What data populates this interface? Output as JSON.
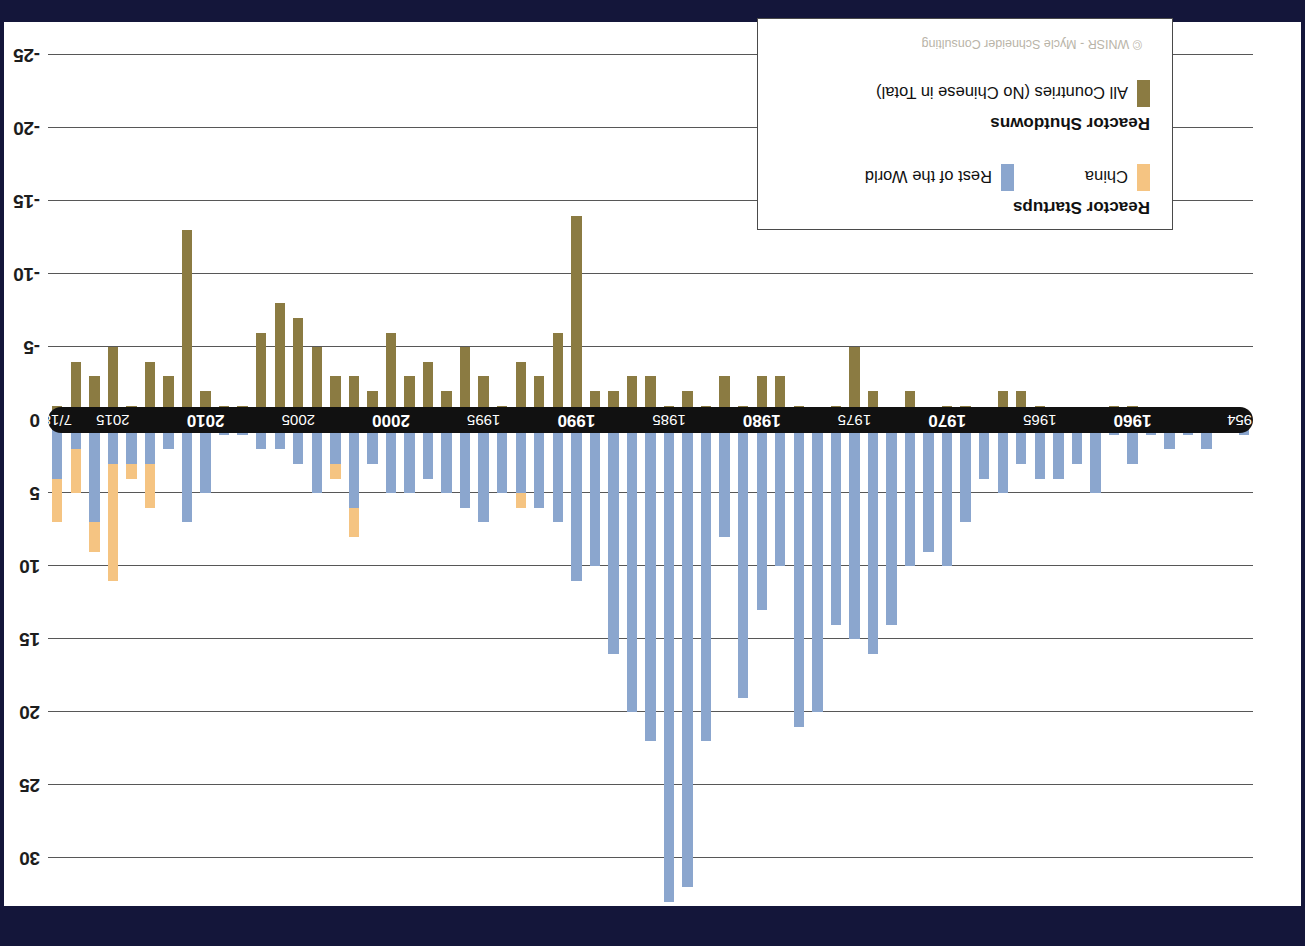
{
  "figure": {
    "orientation": "upside-down",
    "credit": "© WNISR - Mycle Schneider Consulting",
    "background": "#ffffff",
    "frame_color": "#14163a"
  },
  "colors": {
    "startups_china": "#f5c482",
    "startups_rest_of_world": "#8ba6ce",
    "shutdowns_all": "#8b7b42",
    "axis_band": "#111111",
    "gridline": "#575757"
  },
  "legend": {
    "startups_title": "Reactor Startups",
    "startups_items": [
      {
        "label": "China",
        "color_key": "startups_china"
      },
      {
        "label": "Rest of the World",
        "color_key": "startups_rest_of_world"
      }
    ],
    "shutdowns_title": "Reactor Shutdowns",
    "shutdowns_items": [
      {
        "label": "All Countries (No Chinese in Total)",
        "color_key": "shutdowns_all"
      }
    ],
    "credit": "© WNISR - Mycle Schneider Consulting"
  },
  "axis": {
    "y_ticks": [
      30,
      25,
      20,
      15,
      10,
      5,
      0,
      -5,
      -10,
      -15,
      -20,
      -25
    ],
    "y_tick_labels": [
      "30",
      "25",
      "20",
      "15",
      "10",
      "5",
      "0",
      "-5",
      "-10",
      "-15",
      "-20",
      "-25"
    ],
    "y_min": -27,
    "y_max": 33,
    "x_tick_labels": [
      "1954",
      "1960",
      "1965",
      "1970",
      "1975",
      "1980",
      "1985",
      "1990",
      "1995",
      "2000",
      "2005",
      "2010",
      "2015",
      "7/18"
    ],
    "x_major_labels": [
      "1960",
      "1970",
      "1980",
      "1990",
      "2000",
      "2010"
    ],
    "grid": true
  },
  "chart_data": {
    "type": "bar",
    "title": "",
    "subtitle": "",
    "xlabel": "",
    "ylabel": "",
    "ylim": [
      -27,
      33
    ],
    "stacked": true,
    "note": "Startups plotted positive (stacked: Rest of the World + China); Shutdowns plotted negative.",
    "categories": [
      "1954",
      "1955",
      "1956",
      "1957",
      "1958",
      "1959",
      "1960",
      "1961",
      "1962",
      "1963",
      "1964",
      "1965",
      "1966",
      "1967",
      "1968",
      "1969",
      "1970",
      "1971",
      "1972",
      "1973",
      "1974",
      "1975",
      "1976",
      "1977",
      "1978",
      "1979",
      "1980",
      "1981",
      "1982",
      "1983",
      "1984",
      "1985",
      "1986",
      "1987",
      "1988",
      "1989",
      "1990",
      "1991",
      "1992",
      "1993",
      "1994",
      "1995",
      "1996",
      "1997",
      "1998",
      "1999",
      "2000",
      "2001",
      "2002",
      "2003",
      "2004",
      "2005",
      "2006",
      "2007",
      "2008",
      "2009",
      "2010",
      "2011",
      "2012",
      "2013",
      "2014",
      "2015",
      "2016",
      "2017",
      "7/18"
    ],
    "series": [
      {
        "name": "Rest of the World",
        "color_key": "startups_rest_of_world",
        "values": [
          1,
          0,
          2,
          1,
          2,
          1,
          3,
          1,
          5,
          3,
          4,
          4,
          3,
          5,
          4,
          7,
          10,
          9,
          10,
          14,
          16,
          15,
          14,
          20,
          21,
          10,
          13,
          19,
          8,
          22,
          32,
          33,
          22,
          20,
          16,
          10,
          11,
          7,
          6,
          5,
          5,
          7,
          6,
          5,
          4,
          5,
          5,
          3,
          6,
          3,
          5,
          3,
          2,
          2,
          1,
          1,
          5,
          7,
          2,
          3,
          3,
          3,
          7,
          2,
          4
        ]
      },
      {
        "name": "China",
        "color_key": "startups_china",
        "values": [
          0,
          0,
          0,
          0,
          0,
          0,
          0,
          0,
          0,
          0,
          0,
          0,
          0,
          0,
          0,
          0,
          0,
          0,
          0,
          0,
          0,
          0,
          0,
          0,
          0,
          0,
          0,
          0,
          0,
          0,
          0,
          0,
          0,
          0,
          0,
          0,
          0,
          0,
          0,
          1,
          0,
          0,
          0,
          0,
          0,
          0,
          0,
          0,
          2,
          1,
          0,
          0,
          0,
          0,
          0,
          0,
          0,
          0,
          0,
          3,
          1,
          8,
          2,
          3,
          3
        ]
      },
      {
        "name": "All Countries (Shutdowns)",
        "color_key": "shutdowns_all",
        "values": [
          0,
          0,
          0,
          0,
          0,
          0,
          1,
          1,
          0,
          0,
          0,
          1,
          2,
          2,
          0,
          1,
          1,
          0,
          2,
          0,
          2,
          5,
          1,
          0,
          1,
          3,
          3,
          1,
          3,
          1,
          2,
          1,
          3,
          3,
          2,
          2,
          14,
          6,
          3,
          4,
          1,
          3,
          5,
          2,
          4,
          3,
          6,
          2,
          3,
          3,
          5,
          7,
          8,
          6,
          1,
          1,
          2,
          13,
          3,
          4,
          1,
          5,
          3,
          4,
          1
        ]
      }
    ],
    "legend_position": "inside-lower-left"
  }
}
